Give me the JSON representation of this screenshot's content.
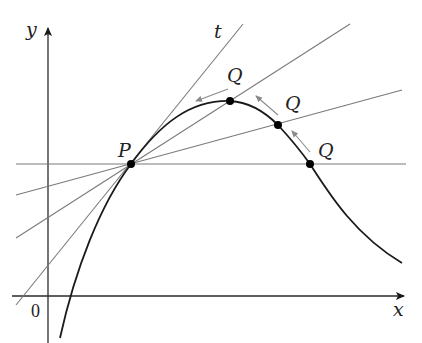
{
  "diagram": {
    "labels": {
      "y_axis": "y",
      "x_axis": "x",
      "origin": "0",
      "point_p": "P",
      "tangent": "t",
      "q1": "Q",
      "q2": "Q",
      "q3": "Q"
    },
    "colors": {
      "curve": "#1a1a1a",
      "axes": "#2a2a2a",
      "secants": "#7a7a7a",
      "arrows": "#8a8a8a",
      "points": "#000000"
    },
    "points": {
      "P": [
        131,
        164
      ],
      "Q1": [
        230,
        101
      ],
      "Q2": [
        278,
        125
      ],
      "Q3": [
        310,
        164
      ]
    },
    "lines": [
      {
        "name": "tangent-t",
        "from": [
          20,
          300
        ],
        "to": [
          243,
          24
        ]
      },
      {
        "name": "secant-PQ1",
        "from": [
          16,
          238
        ],
        "to": [
          350,
          24
        ]
      },
      {
        "name": "secant-PQ2",
        "from": [
          16,
          195
        ],
        "to": [
          402,
          90
        ]
      },
      {
        "name": "secant-PQ3",
        "from": [
          16,
          164
        ],
        "to": [
          406,
          164
        ]
      }
    ]
  }
}
